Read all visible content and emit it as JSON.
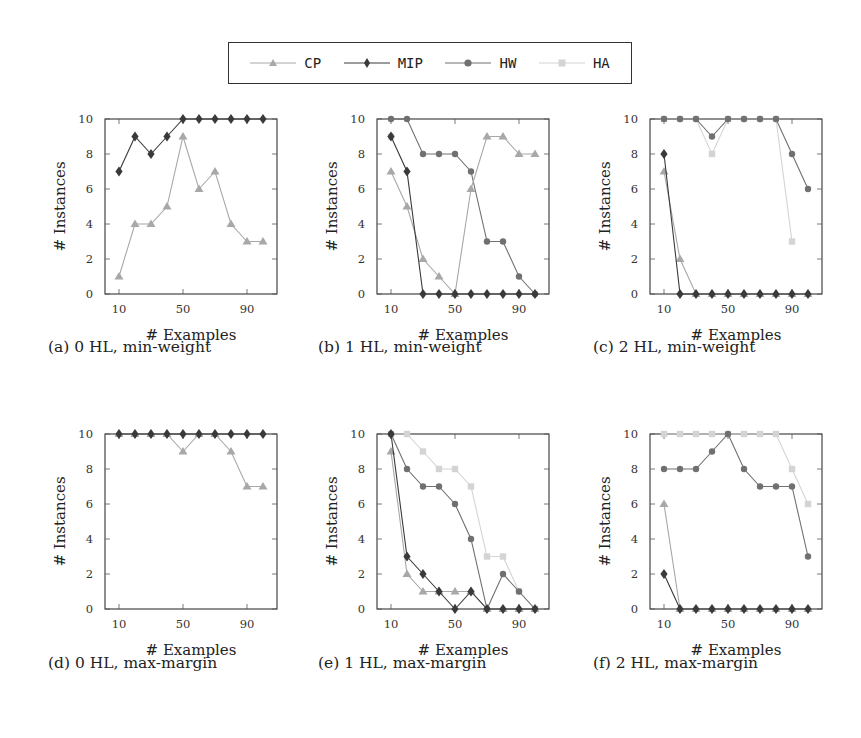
{
  "legend": {
    "items": [
      {
        "name": "CP",
        "color": "#a8a8a8",
        "marker": "triangle"
      },
      {
        "name": "MIP",
        "color": "#3a3a3a",
        "marker": "diamond"
      },
      {
        "name": "HW",
        "color": "#707070",
        "marker": "circle"
      },
      {
        "name": "HA",
        "color": "#d4d4d4",
        "marker": "square"
      }
    ]
  },
  "chart_data": [
    {
      "type": "line",
      "title": "(a) 0 HL, min-weight",
      "xlabel": "# Examples",
      "ylabel": "# Instances",
      "x": [
        10,
        20,
        30,
        40,
        50,
        60,
        70,
        80,
        90,
        100
      ],
      "xticks": [
        10,
        50,
        90
      ],
      "yticks": [
        0,
        2,
        4,
        6,
        8,
        10
      ],
      "ylim": [
        0,
        10
      ],
      "series": [
        {
          "name": "CP",
          "values": [
            1,
            4,
            4,
            5,
            9,
            6,
            7,
            4,
            3,
            3
          ]
        },
        {
          "name": "MIP",
          "values": [
            7,
            9,
            8,
            9,
            10,
            10,
            10,
            10,
            10,
            10
          ]
        }
      ]
    },
    {
      "type": "line",
      "title": "(b) 1 HL, min-weight",
      "xlabel": "# Examples",
      "ylabel": "# Instances",
      "x": [
        10,
        20,
        30,
        40,
        50,
        60,
        70,
        80,
        90,
        100
      ],
      "xticks": [
        10,
        50,
        90
      ],
      "yticks": [
        0,
        2,
        4,
        6,
        8,
        10
      ],
      "ylim": [
        0,
        10
      ],
      "series": [
        {
          "name": "CP",
          "values": [
            7,
            5,
            2,
            1,
            0,
            6,
            9,
            9,
            8,
            8
          ]
        },
        {
          "name": "MIP",
          "values": [
            9,
            7,
            0,
            0,
            0,
            0,
            0,
            0,
            0,
            0
          ]
        },
        {
          "name": "HW",
          "values": [
            10,
            10,
            8,
            8,
            8,
            7,
            3,
            3,
            1,
            0
          ]
        },
        {
          "name": "HA",
          "values": [
            9,
            null,
            null,
            null,
            null,
            null,
            null,
            null,
            null,
            null
          ]
        }
      ]
    },
    {
      "type": "line",
      "title": "(c) 2 HL, min-weight",
      "xlabel": "# Examples",
      "ylabel": "# Instances",
      "x": [
        10,
        20,
        30,
        40,
        50,
        60,
        70,
        80,
        90,
        100
      ],
      "xticks": [
        10,
        50,
        90
      ],
      "yticks": [
        0,
        2,
        4,
        6,
        8,
        10
      ],
      "ylim": [
        0,
        10
      ],
      "series": [
        {
          "name": "CP",
          "values": [
            7,
            2,
            0,
            0,
            0,
            0,
            0,
            0,
            0,
            0
          ]
        },
        {
          "name": "MIP",
          "values": [
            8,
            0,
            0,
            0,
            0,
            0,
            0,
            0,
            0,
            0
          ]
        },
        {
          "name": "HW",
          "values": [
            10,
            10,
            10,
            9,
            10,
            10,
            10,
            10,
            8,
            6
          ]
        },
        {
          "name": "HA",
          "values": [
            10,
            10,
            10,
            8,
            10,
            10,
            10,
            10,
            3,
            null
          ]
        }
      ]
    },
    {
      "type": "line",
      "title": "(d) 0 HL, max-margin",
      "xlabel": "# Examples",
      "ylabel": "# Instances",
      "x": [
        10,
        20,
        30,
        40,
        50,
        60,
        70,
        80,
        90,
        100
      ],
      "xticks": [
        10,
        50,
        90
      ],
      "yticks": [
        0,
        2,
        4,
        6,
        8,
        10
      ],
      "ylim": [
        0,
        10
      ],
      "series": [
        {
          "name": "CP",
          "values": [
            10,
            10,
            10,
            10,
            9,
            10,
            10,
            9,
            7,
            7
          ]
        },
        {
          "name": "MIP",
          "values": [
            10,
            10,
            10,
            10,
            10,
            10,
            10,
            10,
            10,
            10
          ]
        }
      ]
    },
    {
      "type": "line",
      "title": "(e) 1 HL, max-margin",
      "xlabel": "# Examples",
      "ylabel": "# Instances",
      "x": [
        10,
        20,
        30,
        40,
        50,
        60,
        70,
        80,
        90,
        100
      ],
      "xticks": [
        10,
        50,
        90
      ],
      "yticks": [
        0,
        2,
        4,
        6,
        8,
        10
      ],
      "ylim": [
        0,
        10
      ],
      "series": [
        {
          "name": "CP",
          "values": [
            9,
            2,
            1,
            1,
            1,
            1,
            0,
            0,
            0,
            0
          ]
        },
        {
          "name": "MIP",
          "values": [
            10,
            3,
            2,
            1,
            0,
            1,
            0,
            0,
            0,
            0
          ]
        },
        {
          "name": "HW",
          "values": [
            10,
            8,
            7,
            7,
            6,
            4,
            0,
            2,
            1,
            0
          ]
        },
        {
          "name": "HA",
          "values": [
            10,
            10,
            9,
            8,
            8,
            7,
            3,
            3,
            1,
            0
          ]
        }
      ]
    },
    {
      "type": "line",
      "title": "(f) 2 HL, max-margin",
      "xlabel": "# Examples",
      "ylabel": "# Instances",
      "x": [
        10,
        20,
        30,
        40,
        50,
        60,
        70,
        80,
        90,
        100
      ],
      "xticks": [
        10,
        50,
        90
      ],
      "yticks": [
        0,
        2,
        4,
        6,
        8,
        10
      ],
      "ylim": [
        0,
        10
      ],
      "series": [
        {
          "name": "CP",
          "values": [
            6,
            0,
            0,
            0,
            0,
            0,
            0,
            0,
            0,
            0
          ]
        },
        {
          "name": "MIP",
          "values": [
            2,
            0,
            0,
            0,
            0,
            0,
            0,
            0,
            0,
            0
          ]
        },
        {
          "name": "HW",
          "values": [
            8,
            8,
            8,
            9,
            10,
            8,
            7,
            7,
            7,
            3
          ]
        },
        {
          "name": "HA",
          "values": [
            10,
            10,
            10,
            10,
            10,
            10,
            10,
            10,
            8,
            6
          ]
        }
      ]
    }
  ]
}
